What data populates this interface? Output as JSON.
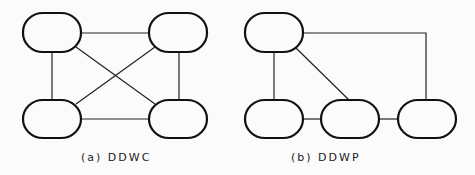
{
  "diagrams": [
    {
      "id": "a",
      "caption": "(a) DDWC",
      "nodes": [
        "n1",
        "n2",
        "n3",
        "n4"
      ],
      "edges": [
        [
          "n1",
          "n2"
        ],
        [
          "n1",
          "n3"
        ],
        [
          "n2",
          "n4"
        ],
        [
          "n3",
          "n4"
        ],
        [
          "n1",
          "n4"
        ],
        [
          "n2",
          "n3"
        ]
      ]
    },
    {
      "id": "b",
      "caption": "(b) DDWP",
      "nodes": [
        "n1",
        "n2",
        "n3",
        "n4"
      ],
      "edges": [
        [
          "n1",
          "n2"
        ],
        [
          "n1",
          "n3"
        ],
        [
          "n1",
          "n4"
        ],
        [
          "n2",
          "n3"
        ],
        [
          "n3",
          "n4"
        ]
      ]
    }
  ]
}
